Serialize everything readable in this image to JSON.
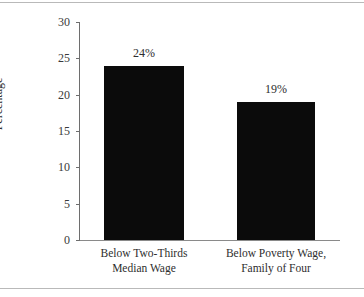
{
  "chart_data": {
    "type": "bar",
    "title": "",
    "subtitle": "",
    "xlabel": "",
    "ylabel": "Percentage",
    "ylim": [
      0,
      30
    ],
    "yticks": [
      0,
      5,
      10,
      15,
      20,
      25,
      30
    ],
    "ytick_labels": [
      "0",
      "5",
      "10",
      "15",
      "20",
      "25",
      "30"
    ],
    "grid": false,
    "legend": false,
    "bar_color": "#0b0b0b",
    "categories": [
      "Below Two-Thirds\nMedian Wage",
      "Below Poverty Wage,\nFamily of Four"
    ],
    "values": [
      24,
      19
    ],
    "data_labels": [
      "24%",
      "19%"
    ]
  },
  "axes": {
    "y_title": "Percentage"
  }
}
